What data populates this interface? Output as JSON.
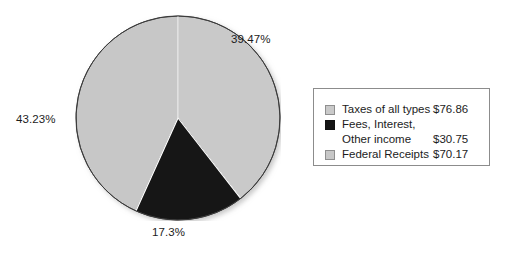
{
  "chart_data": {
    "type": "pie",
    "title": "",
    "subtitle": "",
    "xlabel": "",
    "ylabel": "",
    "grid": false,
    "legend_position": "right",
    "start_angle_deg": 0,
    "direction": "clockwise",
    "categories": [
      "Taxes of all types",
      "Fees, Interest,\nOther income",
      "Federal Receipts"
    ],
    "values": [
      76.86,
      30.75,
      70.17
    ],
    "value_labels": [
      "$76.86",
      "$30.75",
      "$70.17"
    ],
    "percents": [
      39.47,
      17.3,
      43.23
    ],
    "percent_labels": [
      "39.47%",
      "17.3%",
      "43.23%"
    ],
    "colors": [
      "#c9c9c9",
      "#151515",
      "#c7c7c7"
    ],
    "slices": [
      {
        "name": "Taxes of all types",
        "value": 76.86,
        "value_label": "$76.86",
        "percent": 39.47,
        "percent_label": "39.47%",
        "color": "#c9c9c9"
      },
      {
        "name": "Fees, Interest,\nOther income",
        "value": 30.75,
        "value_label": "$30.75",
        "percent": 17.3,
        "percent_label": "17.3%",
        "color": "#151515"
      },
      {
        "name": "Federal Receipts",
        "value": 70.17,
        "value_label": "$70.17",
        "percent": 43.23,
        "percent_label": "43.23%",
        "color": "#c7c7c7"
      }
    ]
  },
  "pie": {
    "label_taxes": "39.47%",
    "label_fees": "17.3%",
    "label_federal": "43.23%"
  },
  "legend": {
    "rows": [
      {
        "label": "Taxes of all types",
        "value": "$76.86"
      },
      {
        "label": "Fees, Interest,\nOther income",
        "value": "$30.75"
      },
      {
        "label": "Federal Receipts",
        "value": "$70.17"
      }
    ]
  },
  "colors": {
    "slice_light_gray": "#c9c9c9",
    "slice_gray": "#c7c7c7",
    "slice_black": "#151515",
    "outline": "#3a3a3a",
    "separator": "#ffffff",
    "legend_border": "#8c8c8c",
    "text": "#1c1c1c",
    "background": "#ffffff"
  }
}
